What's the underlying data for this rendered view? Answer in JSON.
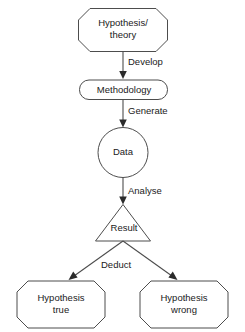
{
  "diagram": {
    "background_color": "#ffffff",
    "stroke_color": "#4d4d4d",
    "text_color": "#1a1a1a",
    "nodes": {
      "hypothesis_theory": {
        "label": "Hypothesis/\ntheory",
        "shape": "octagon"
      },
      "methodology": {
        "label": "Methodology",
        "shape": "rounded-rectangle"
      },
      "data": {
        "label": "Data",
        "shape": "circle"
      },
      "result": {
        "label": "Result",
        "shape": "triangle"
      },
      "hypothesis_true": {
        "label": "Hypothesis\ntrue",
        "shape": "octagon"
      },
      "hypothesis_wrong": {
        "label": "Hypothesis\nwrong",
        "shape": "octagon"
      }
    },
    "edges": {
      "develop": {
        "label": "Develop",
        "from": "hypothesis_theory",
        "to": "methodology"
      },
      "generate": {
        "label": "Generate",
        "from": "methodology",
        "to": "data"
      },
      "analyse": {
        "label": "Analyse",
        "from": "data",
        "to": "result"
      },
      "deduct": {
        "label": "Deduct",
        "from": "result",
        "to": "hypothesis_true / hypothesis_wrong"
      }
    }
  }
}
